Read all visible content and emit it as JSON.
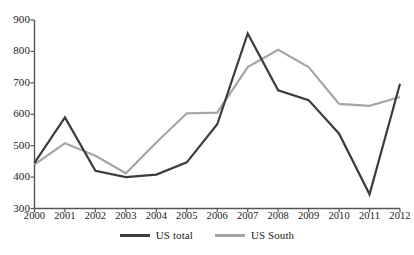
{
  "chart_data": {
    "type": "line",
    "title": "",
    "subtitle": "",
    "xlabel": "",
    "ylabel": "",
    "categories": [
      "2000",
      "2001",
      "2002",
      "2003",
      "2004",
      "2005",
      "2006",
      "2007",
      "2008",
      "2009",
      "2010",
      "2011",
      "2012"
    ],
    "xlim": [
      2000,
      2012
    ],
    "ylim": [
      300,
      900
    ],
    "yticks": [
      300,
      400,
      500,
      600,
      700,
      800,
      900
    ],
    "ytick_labels": [
      "300",
      "400",
      "500",
      "600",
      "700",
      "800",
      "900"
    ],
    "xticks": [
      "2000",
      "2001",
      "2002",
      "2003",
      "2004",
      "2005",
      "2006",
      "2007",
      "2008",
      "2009",
      "2010",
      "2011",
      "2012"
    ],
    "grid": false,
    "legend_position": "bottom-center",
    "series": [
      {
        "name": "US total",
        "color": "#3c3c3c",
        "values": [
          445,
          590,
          420,
          400,
          408,
          447,
          568,
          857,
          676,
          645,
          538,
          345,
          697
        ]
      },
      {
        "name": "US South",
        "color": "#a6a6a6",
        "values": [
          440,
          508,
          468,
          412,
          510,
          603,
          605,
          750,
          805,
          750,
          633,
          627,
          655
        ]
      }
    ]
  },
  "legend": {
    "items": [
      {
        "label": "US total",
        "swatch": "line-swatch-dark"
      },
      {
        "label": "US South",
        "swatch": "line-swatch-light"
      }
    ]
  },
  "axes": {
    "y_axis_name": "value-axis",
    "x_axis_name": "year-axis"
  },
  "colors": {
    "series_us_total": "#3c3c3c",
    "series_us_south": "#a6a6a6",
    "axis": "#555555",
    "text": "#1a1a1a",
    "background": "#ffffff"
  }
}
